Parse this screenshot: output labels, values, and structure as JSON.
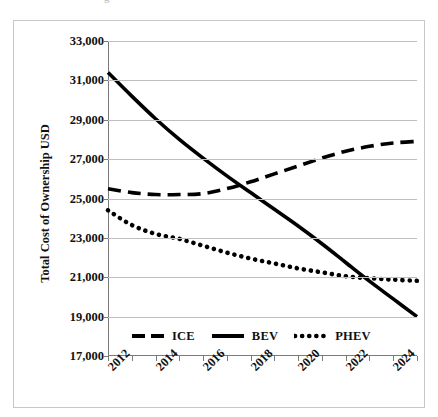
{
  "clipped_caption": "g",
  "chart_data": {
    "type": "line",
    "title": "",
    "xlabel": "",
    "ylabel": "Total Cost of Ownership USD",
    "xlim": [
      2012,
      2025
    ],
    "ylim": [
      17000,
      33000
    ],
    "grid": true,
    "legend_position": "bottom-inside",
    "y_ticks": [
      33000,
      31000,
      29000,
      27000,
      25000,
      23000,
      21000,
      19000,
      17000
    ],
    "y_tick_labels": [
      "33,000",
      "31,000",
      "29,000",
      "27,000",
      "25,000",
      "23,000",
      "21,000",
      "19,000",
      "17,000"
    ],
    "x_ticks": [
      2012,
      2014,
      2016,
      2018,
      2020,
      2022,
      2024
    ],
    "x_tick_labels": [
      "2012",
      "2014",
      "2016",
      "2018",
      "2020",
      "2022",
      "2024"
    ],
    "x_minor_ticks": [
      2012,
      2013,
      2014,
      2015,
      2016,
      2017,
      2018,
      2019,
      2020,
      2021,
      2022,
      2023,
      2024,
      2025
    ],
    "x": [
      2012,
      2013,
      2014,
      2015,
      2016,
      2017,
      2018,
      2019,
      2020,
      2021,
      2022,
      2023,
      2024,
      2025
    ],
    "series": [
      {
        "name": "ICE",
        "style": "dashed",
        "color": "#000000",
        "values": [
          25500,
          25300,
          25200,
          25200,
          25250,
          25500,
          25850,
          26250,
          26650,
          27050,
          27400,
          27650,
          27820,
          27900
        ]
      },
      {
        "name": "BEV",
        "style": "solid",
        "color": "#000000",
        "values": [
          31400,
          30200,
          29050,
          28000,
          27050,
          26150,
          25300,
          24450,
          23600,
          22700,
          21750,
          20800,
          19900,
          19000
        ]
      },
      {
        "name": "PHEV",
        "style": "dotted",
        "color": "#000000",
        "values": [
          24400,
          23650,
          23200,
          22950,
          22600,
          22250,
          21950,
          21700,
          21450,
          21250,
          21050,
          20950,
          20880,
          20820
        ]
      }
    ]
  },
  "legend": {
    "items": [
      {
        "label": "ICE",
        "marker": "dashed-line-swatch"
      },
      {
        "label": "BEV",
        "marker": "solid-line-swatch"
      },
      {
        "label": "PHEV",
        "marker": "dotted-line-swatch"
      }
    ]
  }
}
